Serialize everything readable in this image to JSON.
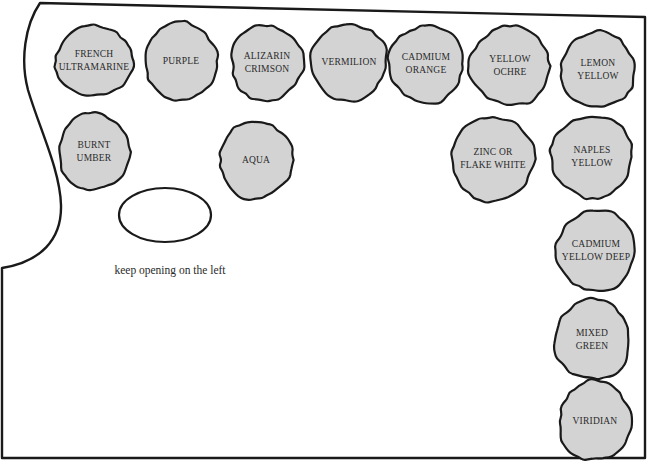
{
  "diagram": {
    "colors": {
      "outline": "#1a1a1a",
      "paint_fill": "#d3d3d3",
      "background": "#ffffff",
      "text": "#2a2a2a"
    },
    "paints": [
      {
        "id": "french-ultramarine",
        "lines": [
          "FRENCH",
          "ULTRAMARINE"
        ],
        "cx": 94,
        "cy": 61,
        "rx": 39,
        "ry": 35
      },
      {
        "id": "purple",
        "lines": [
          "PURPLE"
        ],
        "cx": 181,
        "cy": 61,
        "rx": 36,
        "ry": 39
      },
      {
        "id": "alizarin-crimson",
        "lines": [
          "ALIZARIN",
          "CRIMSON"
        ],
        "cx": 267,
        "cy": 63,
        "rx": 36,
        "ry": 38
      },
      {
        "id": "vermilion",
        "lines": [
          "VERMILION"
        ],
        "cx": 349,
        "cy": 62,
        "rx": 38,
        "ry": 38
      },
      {
        "id": "cadmium-orange",
        "lines": [
          "CADMIUM",
          "ORANGE"
        ],
        "cx": 426,
        "cy": 64,
        "rx": 37,
        "ry": 39
      },
      {
        "id": "yellow-ochre",
        "lines": [
          "YELLOW",
          "OCHRE"
        ],
        "cx": 510,
        "cy": 66,
        "rx": 40,
        "ry": 40
      },
      {
        "id": "lemon-yellow",
        "lines": [
          "LEMON",
          "YELLOW"
        ],
        "cx": 598,
        "cy": 70,
        "rx": 37,
        "ry": 38
      },
      {
        "id": "burnt-umber",
        "lines": [
          "BURNT",
          "UMBER"
        ],
        "cx": 94,
        "cy": 152,
        "rx": 35,
        "ry": 39
      },
      {
        "id": "aqua",
        "lines": [
          "AQUA"
        ],
        "cx": 256,
        "cy": 160,
        "rx": 37,
        "ry": 39
      },
      {
        "id": "zinc-or-flake-white",
        "lines": [
          "ZINC OR",
          "FLAKE WHITE"
        ],
        "cx": 493,
        "cy": 159,
        "rx": 41,
        "ry": 42
      },
      {
        "id": "naples-yellow",
        "lines": [
          "NAPLES",
          "YELLOW"
        ],
        "cx": 592,
        "cy": 157,
        "rx": 41,
        "ry": 41
      },
      {
        "id": "cadmium-yellow-deep",
        "lines": [
          "CADMIUM",
          "YELLOW DEEP"
        ],
        "cx": 596,
        "cy": 251,
        "rx": 39,
        "ry": 41
      },
      {
        "id": "mixed-green",
        "lines": [
          "MIXED",
          "GREEN"
        ],
        "cx": 592,
        "cy": 340,
        "rx": 38,
        "ry": 40
      },
      {
        "id": "viridian",
        "lines": [
          "VIRIDIAN"
        ],
        "cx": 595,
        "cy": 421,
        "rx": 36,
        "ry": 40
      }
    ],
    "opening": {
      "cx": 165,
      "cy": 215,
      "rx": 46,
      "ry": 27
    },
    "caption": "keep opening on the left"
  }
}
